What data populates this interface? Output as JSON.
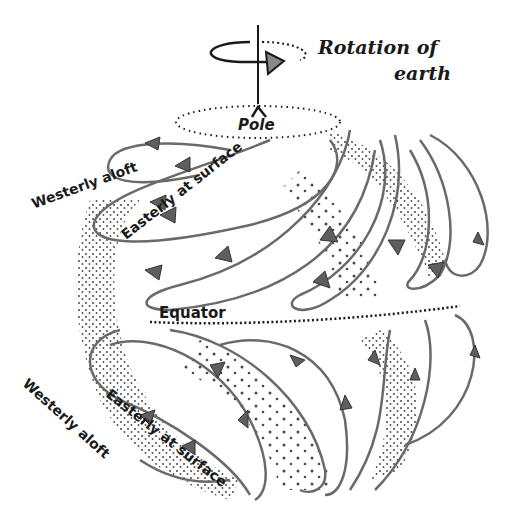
{
  "diagram": {
    "type": "atmospheric-circulation-globe",
    "style": "hand-drawn ink illustration",
    "colors": {
      "background": "#ffffff",
      "ink": "#1a1a1a",
      "flow_line": "#6a6a6a",
      "arrow_fill": "#5e5e5e",
      "stipple": "#2a2a2a"
    },
    "labels": {
      "rotation_line1": "Rotation of",
      "rotation_line2": "earth",
      "pole": "Pole",
      "equator": "Equator",
      "north_westerly": "Westerly aloft",
      "north_easterly": "Easterly at surface",
      "south_westerly": "Westerly aloft",
      "south_easterly": "Easterly at surface"
    },
    "elements": [
      {
        "name": "rotation-axis",
        "description": "vertical axis line above pole"
      },
      {
        "name": "rotation-arrow",
        "description": "elliptical arrow around axis pointing right"
      },
      {
        "name": "pole-marker",
        "description": "caret mark at top of globe"
      },
      {
        "name": "equator-line",
        "description": "dotted line across the middle of the globe"
      },
      {
        "name": "northern-circulation-loops",
        "description": "looping streamlines with arrowheads in northern hemisphere"
      },
      {
        "name": "southern-circulation-loops",
        "description": "looping streamlines with arrowheads in southern hemisphere"
      }
    ]
  }
}
